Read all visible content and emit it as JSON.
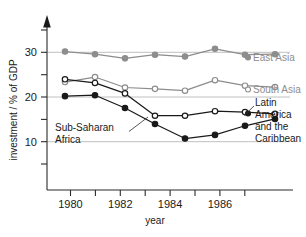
{
  "chart_data": {
    "type": "line",
    "title": "",
    "xlabel": "year",
    "ylabel": "investment / % of GDP",
    "x": [
      1980,
      1981,
      1982,
      1983,
      1984,
      1985,
      1986,
      1987
    ],
    "xlim": [
      1979.4,
      1987.6
    ],
    "ylim": [
      0,
      36
    ],
    "xticks": [
      1980,
      1981,
      1982,
      1983,
      1984,
      1985,
      1986,
      1987
    ],
    "xticklabels": [
      "1980",
      "",
      "1982",
      "",
      "1984",
      "",
      "1986",
      ""
    ],
    "yticks": [
      5,
      10,
      15,
      20,
      25,
      30,
      35
    ],
    "yticklabels": [
      "",
      "10",
      "",
      "20",
      "",
      "30",
      ""
    ],
    "grid": "horizontal gridlines at y = 10, 20, 30",
    "legend": "inline labels at right end of each series",
    "series": [
      {
        "name": "East Asia",
        "color": "#8d8d8d",
        "marker": "filled-circle",
        "label_color": "#8d8d8d",
        "values": [
          30.4,
          29.8,
          28.9,
          29.7,
          29.3,
          31.0,
          29.7,
          29.8
        ]
      },
      {
        "name": "South Asia",
        "color": "#8d8d8d",
        "marker": "open-circle",
        "label_color": "#8d8d8d",
        "values": [
          23.7,
          24.8,
          22.5,
          22.2,
          21.8,
          24.1,
          22.9,
          22.6
        ]
      },
      {
        "name": "Latin America and the Caribbean",
        "color": "#1a1a1a",
        "marker": "open-circle",
        "label_color": "#1a1a1a",
        "values": [
          24.3,
          23.5,
          21.2,
          16.3,
          16.3,
          17.3,
          17.1,
          16.7
        ]
      },
      {
        "name": "Sub-Saharan Africa",
        "color": "#1a1a1a",
        "marker": "filled-circle",
        "label_color": "#1a1a1a",
        "values": [
          20.6,
          20.8,
          18.0,
          14.5,
          11.3,
          12.1,
          14.1,
          15.6
        ]
      }
    ]
  },
  "labels": {
    "y_axis_title": "investment / % of GDP",
    "x_axis_title": "year",
    "east_asia": "East Asia",
    "south_asia": "South Asia",
    "latin_america_line1": "Latin",
    "latin_america_line2": "America",
    "latin_america_line3": "and the",
    "latin_america_line4": "Caribbean",
    "sub_saharan_line1": "Sub-Saharan",
    "sub_saharan_line2": "Africa",
    "ytick_10": "10",
    "ytick_20": "20",
    "ytick_30": "30",
    "xtick_1980": "1980",
    "xtick_1982": "1982",
    "xtick_1984": "1984",
    "xtick_1986": "1986"
  },
  "colors": {
    "dark": "#1a1a1a",
    "gray": "#8d8d8d",
    "gridline": "#b9b9b9",
    "background": "#ffffff"
  }
}
